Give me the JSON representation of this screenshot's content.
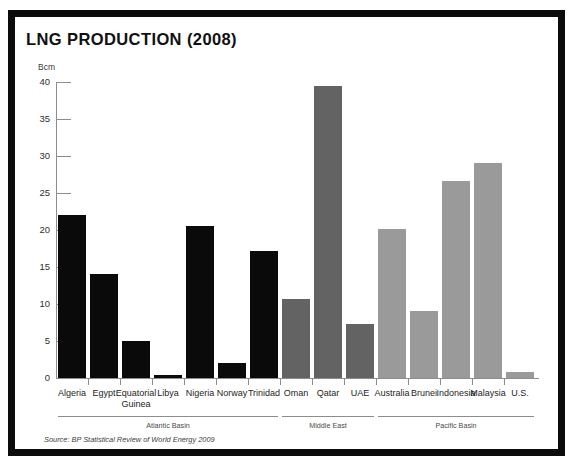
{
  "chart_data": {
    "type": "bar",
    "title": "LNG PRODUCTION (2008)",
    "xlabel": "",
    "ylabel": "Bcm",
    "ylim": [
      0,
      40
    ],
    "yticks": [
      0,
      5,
      10,
      15,
      20,
      25,
      30,
      35,
      40
    ],
    "ytick_labels": [
      "0",
      "5",
      "10",
      "15",
      "20",
      "25",
      "30",
      "35",
      "40"
    ],
    "grid": false,
    "legend": "none",
    "categories": [
      "Algeria",
      "Egypt",
      "Equatorial Guinea",
      "Libya",
      "Nigeria",
      "Norway",
      "Trinidad",
      "Oman",
      "Qatar",
      "UAE",
      "Australia",
      "Brunei",
      "Indonesia",
      "Malaysia",
      "U.S."
    ],
    "values": [
      22.0,
      14.0,
      5.0,
      0.4,
      20.5,
      2.0,
      17.2,
      10.7,
      39.5,
      7.3,
      20.1,
      9.0,
      26.6,
      29.0,
      0.8
    ],
    "groups": [
      {
        "name": "Atlantic Basin",
        "color": "#0a0a0a",
        "members": [
          "Algeria",
          "Egypt",
          "Equatorial Guinea",
          "Libya",
          "Nigeria",
          "Norway",
          "Trinidad"
        ]
      },
      {
        "name": "Middle East",
        "color": "#636363",
        "members": [
          "Oman",
          "Qatar",
          "UAE"
        ]
      },
      {
        "name": "Pacific Basin",
        "color": "#9a9a9a",
        "members": [
          "Australia",
          "Brunei",
          "Indonesia",
          "Malaysia",
          "U.S."
        ]
      }
    ],
    "annotations": [
      "Source: BP Statistical Review of World Energy 2009"
    ],
    "source": "Source: BP Statistical Review of World Energy 2009"
  },
  "bars": [
    {
      "label": "Algeria",
      "label_line1": "Algeria",
      "label_line2": "",
      "value": 22.0,
      "group": "atlantic"
    },
    {
      "label": "Egypt",
      "label_line1": "Egypt",
      "label_line2": "",
      "value": 14.0,
      "group": "atlantic"
    },
    {
      "label": "Equatorial Guinea",
      "label_line1": "Equatorial",
      "label_line2": "Guinea",
      "value": 5.0,
      "group": "atlantic"
    },
    {
      "label": "Libya",
      "label_line1": "Libya",
      "label_line2": "",
      "value": 0.4,
      "group": "atlantic"
    },
    {
      "label": "Nigeria",
      "label_line1": "Nigeria",
      "label_line2": "",
      "value": 20.5,
      "group": "atlantic"
    },
    {
      "label": "Norway",
      "label_line1": "Norway",
      "label_line2": "",
      "value": 2.0,
      "group": "atlantic"
    },
    {
      "label": "Trinidad",
      "label_line1": "Trinidad",
      "label_line2": "",
      "value": 17.2,
      "group": "atlantic"
    },
    {
      "label": "Oman",
      "label_line1": "Oman",
      "label_line2": "",
      "value": 10.7,
      "group": "middle"
    },
    {
      "label": "Qatar",
      "label_line1": "Qatar",
      "label_line2": "",
      "value": 39.5,
      "group": "middle"
    },
    {
      "label": "UAE",
      "label_line1": "UAE",
      "label_line2": "",
      "value": 7.3,
      "group": "middle"
    },
    {
      "label": "Australia",
      "label_line1": "Australia",
      "label_line2": "",
      "value": 20.1,
      "group": "pacific"
    },
    {
      "label": "Brunei",
      "label_line1": "Brunei",
      "label_line2": "",
      "value": 9.0,
      "group": "pacific"
    },
    {
      "label": "Indonesia",
      "label_line1": "Indonesia",
      "label_line2": "",
      "value": 26.6,
      "group": "pacific"
    },
    {
      "label": "Malaysia",
      "label_line1": "Malaysia",
      "label_line2": "",
      "value": 29.0,
      "group": "pacific"
    },
    {
      "label": "U.S.",
      "label_line1": "U.S.",
      "label_line2": "",
      "value": 0.8,
      "group": "pacific"
    }
  ],
  "groups": [
    {
      "name": "Atlantic Basin",
      "start": 0,
      "end": 6
    },
    {
      "name": "Middle East",
      "start": 7,
      "end": 9
    },
    {
      "name": "Pacific Basin",
      "start": 10,
      "end": 14
    }
  ],
  "colors": {
    "atlantic": "#0a0a0a",
    "middle": "#636363",
    "pacific": "#9a9a9a",
    "frame": "#0c0c0c",
    "axis": "#8d8d8d",
    "background": "#ffffff"
  }
}
